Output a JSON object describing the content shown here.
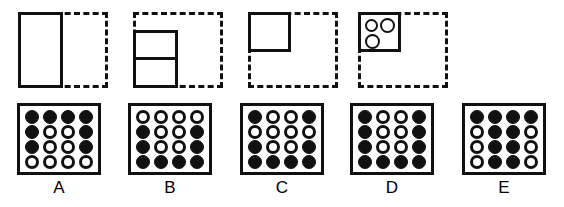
{
  "figure": {
    "stroke_color": "#111111",
    "background_color": "#ffffff"
  },
  "prompt_panels": [
    {
      "id": "panel-a",
      "name": "prompt-panel-1",
      "dashed_frame": "dashed-square",
      "inner_shape": "tall-rectangle-left-half",
      "divider": false,
      "circles": 0,
      "left": 18
    },
    {
      "id": "panel-b",
      "name": "prompt-panel-2",
      "dashed_frame": "dashed-square",
      "inner_shape": "rectangle-bottom-left",
      "divider": true,
      "circles": 0,
      "left": 133
    },
    {
      "id": "panel-c",
      "name": "prompt-panel-3",
      "dashed_frame": "dashed-square",
      "inner_shape": "square-top-left",
      "divider": false,
      "circles": 0,
      "left": 248
    },
    {
      "id": "panel-d",
      "name": "prompt-panel-4",
      "dashed_frame": "dashed-square",
      "inner_shape": "square-top-left-with-circles",
      "divider": false,
      "circles": 3,
      "left": 358
    }
  ],
  "options": [
    {
      "label": "A",
      "left": 17,
      "grid": [
        [
          "filled",
          "filled",
          "filled",
          "filled"
        ],
        [
          "filled",
          "empty",
          "empty",
          "filled"
        ],
        [
          "filled",
          "empty",
          "empty",
          "filled"
        ],
        [
          "empty",
          "empty",
          "empty",
          "empty"
        ]
      ]
    },
    {
      "label": "B",
      "left": 128,
      "grid": [
        [
          "empty",
          "empty",
          "empty",
          "empty"
        ],
        [
          "filled",
          "empty",
          "empty",
          "filled"
        ],
        [
          "filled",
          "empty",
          "empty",
          "filled"
        ],
        [
          "filled",
          "filled",
          "filled",
          "filled"
        ]
      ]
    },
    {
      "label": "C",
      "left": 240,
      "grid": [
        [
          "filled",
          "empty",
          "empty",
          "filled"
        ],
        [
          "empty",
          "empty",
          "empty",
          "empty"
        ],
        [
          "filled",
          "empty",
          "empty",
          "filled"
        ],
        [
          "filled",
          "filled",
          "filled",
          "filled"
        ]
      ]
    },
    {
      "label": "D",
      "left": 350,
      "grid": [
        [
          "filled",
          "empty",
          "empty",
          "filled"
        ],
        [
          "filled",
          "empty",
          "empty",
          "filled"
        ],
        [
          "filled",
          "empty",
          "empty",
          "filled"
        ],
        [
          "filled",
          "filled",
          "filled",
          "filled"
        ]
      ]
    },
    {
      "label": "E",
      "left": 462,
      "grid": [
        [
          "filled",
          "filled",
          "filled",
          "filled"
        ],
        [
          "empty",
          "filled",
          "filled",
          "empty"
        ],
        [
          "empty",
          "filled",
          "filled",
          "empty"
        ],
        [
          "empty",
          "filled",
          "filled",
          "empty"
        ]
      ]
    }
  ]
}
